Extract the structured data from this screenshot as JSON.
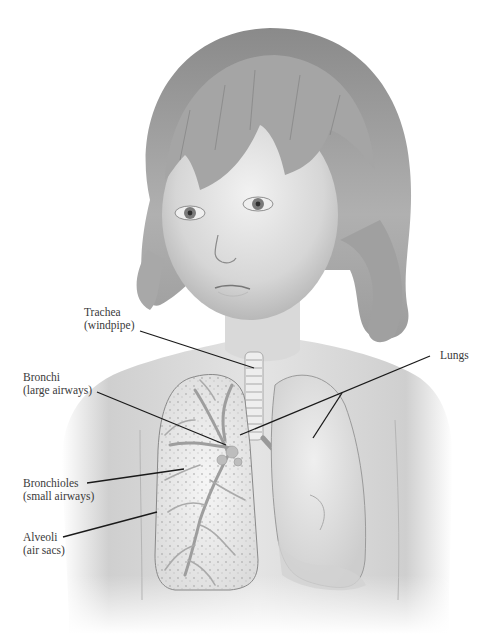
{
  "figure": {
    "colors": {
      "background": "#ffffff",
      "skin": "#dcdcdc",
      "hair": "#9a9a9a",
      "lung": "#ececec",
      "leader_line": "#1a1a1a",
      "label_text": "#3a3a3a"
    }
  },
  "labels": {
    "trachea": {
      "name": "Trachea",
      "desc": "(windpipe)"
    },
    "bronchi": {
      "name": "Bronchi",
      "desc": "(large airways)"
    },
    "bronchioles": {
      "name": "Bronchioles",
      "desc": "(small airways)"
    },
    "alveoli": {
      "name": "Alveoli",
      "desc": "(air sacs)"
    },
    "lungs": {
      "name": "Lungs"
    }
  }
}
